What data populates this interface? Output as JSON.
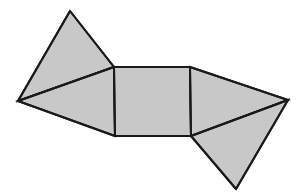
{
  "figure": {
    "name": "polygon-net-diagram",
    "background_color": "#ffffff",
    "fill_color": "#c8c8c8",
    "stroke_color": "#1a1a1a",
    "stroke_width": 2,
    "canvas": {
      "width": 298,
      "height": 196
    },
    "vertices": {
      "top_apex": [
        70,
        11
      ],
      "left_apex": [
        18,
        101
      ],
      "square_top_left": [
        114,
        67
      ],
      "square_top_right": [
        190,
        67
      ],
      "square_bottom_left": [
        115,
        136
      ],
      "square_bottom_right": [
        191,
        136
      ],
      "right_apex": [
        288,
        100
      ],
      "bottom_apex": [
        236,
        189
      ]
    },
    "faces": [
      {
        "label": "upper-left-triangle",
        "points": "70,11 114,67 18,101",
        "fill": "#c8c8c8"
      },
      {
        "label": "left-quadrilateral",
        "points": "18,101 114,67 115,136",
        "fill": "#c8c8c8"
      },
      {
        "label": "center-square",
        "points": "114,67 190,67 191,136 115,136",
        "fill": "#c8c8c8"
      },
      {
        "label": "right-triangle",
        "points": "190,67 288,100 191,136",
        "fill": "#c8c8c8"
      },
      {
        "label": "bottom-right-triangle",
        "points": "191,136 288,100 236,189",
        "fill": "#c8c8c8"
      }
    ],
    "edges": [
      {
        "label": "edge-top-apex-to-square-top-left",
        "x1": 70,
        "y1": 11,
        "x2": 114,
        "y2": 67
      },
      {
        "label": "edge-top-apex-to-left-apex",
        "x1": 70,
        "y1": 11,
        "x2": 18,
        "y2": 101
      },
      {
        "label": "edge-left-apex-to-square-top-left",
        "x1": 18,
        "y1": 101,
        "x2": 114,
        "y2": 67
      },
      {
        "label": "edge-left-apex-to-square-bottom-left",
        "x1": 18,
        "y1": 101,
        "x2": 115,
        "y2": 136
      },
      {
        "label": "edge-square-top",
        "x1": 114,
        "y1": 67,
        "x2": 190,
        "y2": 67
      },
      {
        "label": "edge-square-left",
        "x1": 114,
        "y1": 67,
        "x2": 115,
        "y2": 136
      },
      {
        "label": "edge-square-bottom",
        "x1": 115,
        "y1": 136,
        "x2": 191,
        "y2": 136
      },
      {
        "label": "edge-square-right",
        "x1": 190,
        "y1": 67,
        "x2": 191,
        "y2": 136
      },
      {
        "label": "edge-square-top-right-to-right-apex",
        "x1": 190,
        "y1": 67,
        "x2": 288,
        "y2": 100
      },
      {
        "label": "edge-right-apex-to-square-bottom-right",
        "x1": 288,
        "y1": 100,
        "x2": 191,
        "y2": 136
      },
      {
        "label": "edge-right-apex-to-bottom-apex",
        "x1": 288,
        "y1": 100,
        "x2": 236,
        "y2": 189
      },
      {
        "label": "edge-square-bottom-right-to-bottom-apex",
        "x1": 191,
        "y1": 136,
        "x2": 236,
        "y2": 189
      }
    ]
  }
}
